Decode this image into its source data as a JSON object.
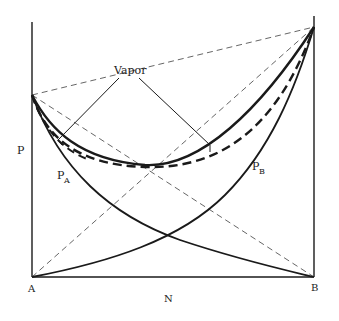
{
  "diagram": {
    "type": "vapor-liquid pressure-composition diagram (minimum pressure azeotrope)",
    "labels": {
      "vapor": "Vapor",
      "y_axis": "P",
      "x_axis": "N",
      "left_corner": "A",
      "right_corner": "B",
      "partial_a": "P",
      "partial_a_sub": "A",
      "partial_b": "P",
      "partial_b_sub": "B"
    },
    "colors": {
      "line": "#1a1a1a",
      "dashed_ideal": "#555555"
    },
    "curves": [
      {
        "name": "total-pressure-liquid",
        "style": "solid-heavy"
      },
      {
        "name": "total-pressure-vapor",
        "style": "dashed-heavy"
      },
      {
        "name": "partial-pressure-A",
        "style": "solid"
      },
      {
        "name": "partial-pressure-B",
        "style": "solid"
      },
      {
        "name": "ideal-total",
        "style": "dashed-thin"
      },
      {
        "name": "ideal-partial-A",
        "style": "dashed-thin"
      },
      {
        "name": "ideal-partial-B",
        "style": "dashed-thin"
      }
    ]
  }
}
